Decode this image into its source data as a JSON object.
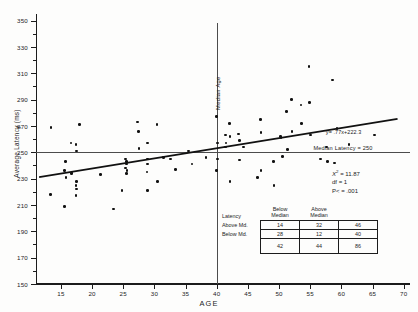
{
  "chart_data": {
    "type": "scatter",
    "title": "",
    "xlabel": "AGE",
    "ylabel": "Average Latency (ms)",
    "xlim": [
      11,
      71
    ],
    "ylim": [
      150,
      355
    ],
    "xticks": [
      15,
      20,
      25,
      30,
      35,
      40,
      45,
      50,
      55,
      60,
      65,
      70
    ],
    "yticks": [
      150,
      170,
      190,
      210,
      230,
      250,
      270,
      290,
      310,
      330,
      350
    ],
    "yticks_minor": [
      160,
      180,
      200,
      220,
      240,
      260,
      280,
      300,
      320,
      340
    ],
    "grid": false,
    "legend": "none",
    "points": [
      [
        13.4,
        269
      ],
      [
        13.3,
        218
      ],
      [
        15.6,
        236
      ],
      [
        15.7,
        243
      ],
      [
        15.8,
        231
      ],
      [
        15.6,
        209
      ],
      [
        16.6,
        257
      ],
      [
        16.7,
        234
      ],
      [
        16.8,
        235
      ],
      [
        17.4,
        256
      ],
      [
        17.5,
        251
      ],
      [
        17.5,
        228
      ],
      [
        17.4,
        225
      ],
      [
        17.5,
        222
      ],
      [
        17.4,
        217
      ],
      [
        18.0,
        271
      ],
      [
        21.3,
        233
      ],
      [
        23.4,
        207
      ],
      [
        24.8,
        221
      ],
      [
        25.4,
        245
      ],
      [
        25.5,
        243
      ],
      [
        25.5,
        241
      ],
      [
        25.4,
        238
      ],
      [
        25.6,
        236
      ],
      [
        25.5,
        234
      ],
      [
        27.3,
        273
      ],
      [
        27.4,
        266
      ],
      [
        27.5,
        253
      ],
      [
        28.9,
        257
      ],
      [
        28.9,
        245
      ],
      [
        28.9,
        241
      ],
      [
        28.8,
        235
      ],
      [
        28.9,
        221
      ],
      [
        30.4,
        271
      ],
      [
        30.5,
        228
      ],
      [
        31.5,
        246
      ],
      [
        32.6,
        245
      ],
      [
        33.4,
        237
      ],
      [
        35.5,
        251
      ],
      [
        36.0,
        241
      ],
      [
        38.3,
        246
      ],
      [
        40.0,
        277
      ],
      [
        40.1,
        257
      ],
      [
        40.1,
        245
      ],
      [
        40.0,
        236
      ],
      [
        41.4,
        263
      ],
      [
        41.5,
        257
      ],
      [
        41.4,
        254
      ],
      [
        42.0,
        272
      ],
      [
        42.1,
        262
      ],
      [
        42.1,
        228
      ],
      [
        43.5,
        264
      ],
      [
        43.6,
        259
      ],
      [
        43.6,
        244
      ],
      [
        44.3,
        254
      ],
      [
        46.5,
        231
      ],
      [
        47.0,
        275
      ],
      [
        47.1,
        265
      ],
      [
        47.1,
        236
      ],
      [
        49.1,
        243
      ],
      [
        49.2,
        225
      ],
      [
        50.2,
        262
      ],
      [
        50.3,
        261
      ],
      [
        50.5,
        247
      ],
      [
        51.2,
        281
      ],
      [
        51.3,
        252
      ],
      [
        52.0,
        290
      ],
      [
        52.1,
        266
      ],
      [
        53.5,
        286
      ],
      [
        53.6,
        272
      ],
      [
        54.8,
        315
      ],
      [
        54.9,
        288
      ],
      [
        55.0,
        263
      ],
      [
        56.6,
        245
      ],
      [
        57.6,
        254
      ],
      [
        57.8,
        243
      ],
      [
        58.6,
        305
      ],
      [
        58.9,
        242
      ],
      [
        59.3,
        268
      ],
      [
        61.2,
        256
      ],
      [
        65.3,
        263
      ]
    ],
    "regression": {
      "equation": "y= .77x+222.3",
      "slope": 0.77,
      "intercept": 222.3
    },
    "reference_lines": [
      {
        "name": "median-age",
        "orientation": "vertical",
        "value": 40,
        "label": "Median Age"
      },
      {
        "name": "median-latency",
        "orientation": "horizontal",
        "value": 250,
        "label": "Median Latency = 250"
      }
    ]
  },
  "axes": {
    "x_title": "AGE",
    "y_title": "Average Latency (ms)"
  },
  "statistics": {
    "chi_symbol": "X",
    "chi_exponent": "2",
    "chi_value": "= 11.87",
    "df": "df = 1",
    "p": "P< = .001"
  },
  "contingency": {
    "corner_label": "Latency",
    "col_headers": [
      "Below\nMedian",
      "Above\nMedian"
    ],
    "col_header_1_line1": "Below",
    "col_header_1_line2": "Median",
    "col_header_2_line1": "Above",
    "col_header_2_line2": "Median",
    "rows": [
      {
        "label": "Above Md.",
        "below": "14",
        "above": "32",
        "total": "46"
      },
      {
        "label": "Below Md.",
        "below": "28",
        "above": "12",
        "total": "40"
      }
    ],
    "totals": {
      "label": "",
      "below": "42",
      "above": "44",
      "total": "86"
    }
  },
  "annotations": {
    "median_age": "Median Age",
    "median_latency": "Median Latency = 250",
    "regression_equation": "y= .77x+222.3"
  }
}
